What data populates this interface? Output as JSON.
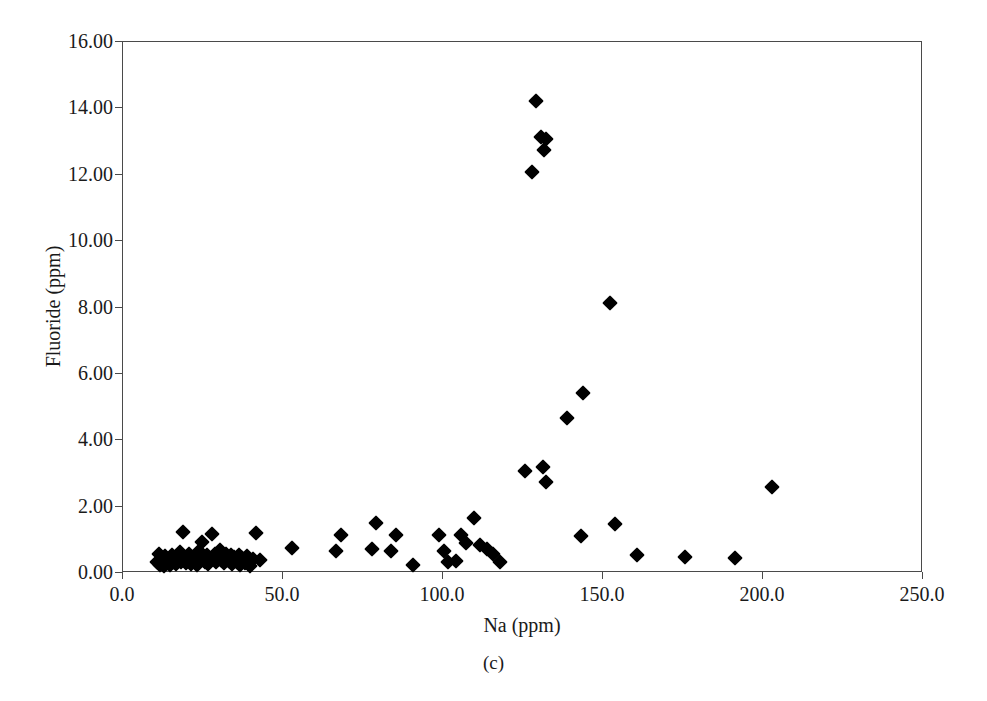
{
  "caption": "(c)",
  "chart_data": {
    "type": "scatter",
    "title": "",
    "subtitle": "",
    "caption": "(c)",
    "xlabel": "Na (ppm)",
    "ylabel": "Fluoride (ppm)",
    "xlim": [
      0.0,
      250.0
    ],
    "ylim": [
      0.0,
      16.0
    ],
    "xticks": [
      0.0,
      50.0,
      100.0,
      150.0,
      200.0,
      250.0
    ],
    "yticks": [
      0.0,
      2.0,
      4.0,
      6.0,
      8.0,
      10.0,
      12.0,
      14.0,
      16.0
    ],
    "xtick_labels": [
      "0.0",
      "50.0",
      "100.0",
      "150.0",
      "200.0",
      "250.0"
    ],
    "ytick_labels": [
      "0.00",
      "2.00",
      "4.00",
      "6.00",
      "8.00",
      "10.00",
      "12.00",
      "14.00",
      "16.00"
    ],
    "grid": false,
    "legend": null,
    "marker": "diamond",
    "marker_color": "#000000",
    "marker_size": 11,
    "series": [
      {
        "name": "samples",
        "points": [
          [
            11.0,
            0.3
          ],
          [
            11.5,
            0.55
          ],
          [
            12.0,
            0.22
          ],
          [
            12.5,
            0.4
          ],
          [
            13.0,
            0.18
          ],
          [
            13.5,
            0.48
          ],
          [
            14.0,
            0.28
          ],
          [
            14.5,
            0.35
          ],
          [
            15.0,
            0.2
          ],
          [
            15.5,
            0.52
          ],
          [
            16.0,
            0.3
          ],
          [
            16.5,
            0.42
          ],
          [
            17.0,
            0.25
          ],
          [
            17.5,
            0.38
          ],
          [
            18.0,
            0.6
          ],
          [
            18.5,
            0.3
          ],
          [
            19.0,
            1.2
          ],
          [
            19.5,
            0.45
          ],
          [
            20.0,
            0.28
          ],
          [
            20.5,
            0.35
          ],
          [
            21.0,
            0.55
          ],
          [
            21.5,
            0.25
          ],
          [
            22.0,
            0.4
          ],
          [
            22.5,
            0.32
          ],
          [
            23.0,
            0.48
          ],
          [
            23.5,
            0.22
          ],
          [
            24.0,
            0.62
          ],
          [
            24.5,
            0.35
          ],
          [
            25.0,
            0.9
          ],
          [
            25.5,
            0.42
          ],
          [
            26.0,
            0.3
          ],
          [
            26.5,
            0.5
          ],
          [
            27.0,
            0.25
          ],
          [
            27.5,
            0.38
          ],
          [
            28.0,
            1.15
          ],
          [
            28.5,
            0.45
          ],
          [
            29.0,
            0.55
          ],
          [
            29.5,
            0.3
          ],
          [
            30.0,
            0.42
          ],
          [
            30.5,
            0.65
          ],
          [
            31.0,
            0.35
          ],
          [
            31.5,
            0.48
          ],
          [
            32.0,
            0.28
          ],
          [
            32.5,
            0.55
          ],
          [
            33.0,
            0.4
          ],
          [
            33.5,
            0.33
          ],
          [
            34.0,
            0.5
          ],
          [
            34.5,
            0.25
          ],
          [
            35.0,
            0.45
          ],
          [
            35.5,
            0.38
          ],
          [
            36.0,
            0.3
          ],
          [
            36.5,
            0.52
          ],
          [
            37.0,
            0.22
          ],
          [
            37.5,
            0.42
          ],
          [
            38.0,
            0.35
          ],
          [
            38.5,
            0.28
          ],
          [
            39.0,
            0.48
          ],
          [
            40.0,
            0.18
          ],
          [
            41.0,
            0.4
          ],
          [
            42.0,
            1.18
          ],
          [
            43.0,
            0.35
          ],
          [
            53.0,
            0.72
          ],
          [
            67.0,
            0.62
          ],
          [
            68.5,
            1.12
          ],
          [
            78.0,
            0.68
          ],
          [
            79.5,
            1.48
          ],
          [
            84.0,
            0.62
          ],
          [
            85.5,
            1.1
          ],
          [
            91.0,
            0.22
          ],
          [
            99.0,
            1.12
          ],
          [
            100.5,
            0.62
          ],
          [
            102.0,
            0.3
          ],
          [
            104.5,
            0.32
          ],
          [
            106.0,
            1.12
          ],
          [
            107.5,
            0.88
          ],
          [
            110.0,
            1.62
          ],
          [
            112.0,
            0.82
          ],
          [
            114.0,
            0.68
          ],
          [
            116.0,
            0.55
          ],
          [
            118.0,
            0.3
          ],
          [
            126.0,
            3.05
          ],
          [
            128.0,
            12.05
          ],
          [
            129.5,
            14.2
          ],
          [
            131.0,
            13.1
          ],
          [
            132.5,
            13.05
          ],
          [
            132.0,
            12.72
          ],
          [
            131.5,
            3.15
          ],
          [
            132.5,
            2.7
          ],
          [
            139.0,
            4.65
          ],
          [
            144.0,
            5.38
          ],
          [
            143.5,
            1.08
          ],
          [
            152.5,
            8.1
          ],
          [
            154.0,
            1.45
          ],
          [
            161.0,
            0.52
          ],
          [
            176.0,
            0.45
          ],
          [
            191.5,
            0.42
          ],
          [
            203.0,
            2.55
          ]
        ]
      }
    ]
  }
}
